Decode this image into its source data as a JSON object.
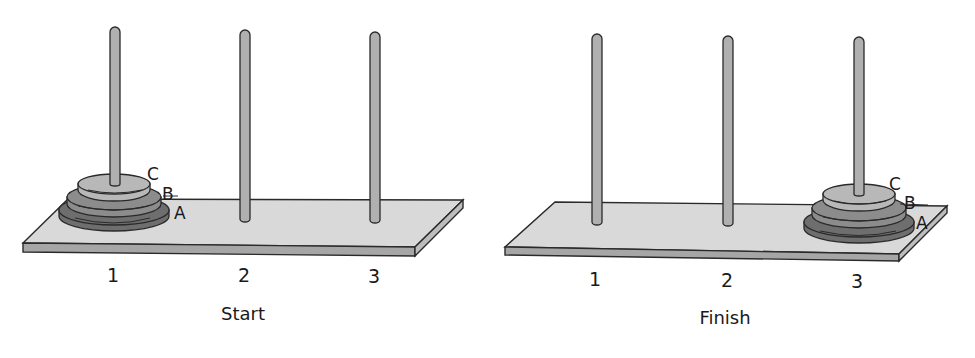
{
  "panels": [
    {
      "caption": "Start",
      "pegs": [
        {
          "label": "1",
          "disks": [
            "A",
            "B",
            "C"
          ]
        },
        {
          "label": "2",
          "disks": []
        },
        {
          "label": "3",
          "disks": []
        }
      ],
      "disk_labels": {
        "a": "A",
        "b": "B",
        "c": "C"
      }
    },
    {
      "caption": "Finish",
      "pegs": [
        {
          "label": "1",
          "disks": []
        },
        {
          "label": "2",
          "disks": []
        },
        {
          "label": "3",
          "disks": [
            "A",
            "B",
            "C"
          ]
        }
      ],
      "disk_labels": {
        "a": "A",
        "b": "B",
        "c": "C"
      }
    }
  ],
  "colors": {
    "board_top": "#d9d9d9",
    "board_edge": "#a6a6a6",
    "peg": "#b0b0b0",
    "disk_a": "#6e6e6e",
    "disk_b": "#8c8c8c",
    "disk_c": "#b8b8b8",
    "outline": "#2a2a2a"
  }
}
